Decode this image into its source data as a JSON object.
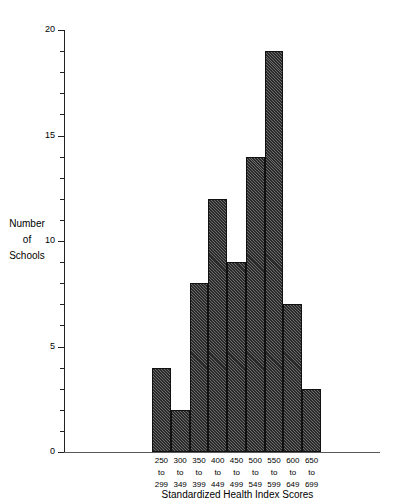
{
  "chart_data": {
    "type": "bar",
    "title": "",
    "subtitle": "",
    "xlabel": "Standardized Health Index Scores",
    "ylabel": "Number of Schools",
    "ylabel_lines": [
      "Number",
      "of",
      "Schools"
    ],
    "categories": [
      "250 to 299",
      "300 to 349",
      "350 to 399",
      "400 to 449",
      "450 to 499",
      "500 to 549",
      "550 to 599",
      "600 to 649",
      "650 to 699"
    ],
    "category_label_lines": [
      [
        "250",
        "to",
        "299"
      ],
      [
        "300",
        "to",
        "349"
      ],
      [
        "350",
        "to",
        "399"
      ],
      [
        "400",
        "to",
        "449"
      ],
      [
        "450",
        "to",
        "499"
      ],
      [
        "500",
        "to",
        "549"
      ],
      [
        "550",
        "to",
        "599"
      ],
      [
        "600",
        "to",
        "649"
      ],
      [
        "650",
        "to",
        "699"
      ]
    ],
    "values": [
      4,
      2,
      8,
      12,
      9,
      14,
      19,
      7,
      3
    ],
    "ylim": [
      0,
      20
    ],
    "y_major_ticks": [
      0,
      5,
      10,
      15,
      20
    ],
    "y_major_tick_labels": [
      "0",
      "5",
      "10",
      "15",
      "20"
    ],
    "y_minor_ticks": [
      1,
      2,
      3,
      4,
      6,
      7,
      8,
      9,
      11,
      12,
      13,
      14,
      16,
      17,
      18,
      19
    ],
    "grid": false,
    "legend": false,
    "bar_fill": "#2b2b2b",
    "bar_pattern": "diagonal-hatch",
    "axis_color": "#222222"
  }
}
